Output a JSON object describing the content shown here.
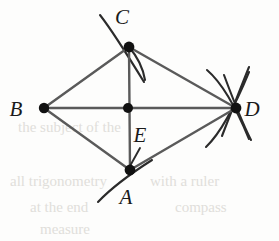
{
  "figure": {
    "type": "geometry-diagram",
    "background_color": "#fdfdfc",
    "line_color": "#5a5a5a",
    "arc_color": "#2b2b2b",
    "point_color": "#111111",
    "label_color": "#1a1a1a",
    "points": [
      {
        "id": "A",
        "label": "A",
        "x": 130,
        "y": 170,
        "label_x": 122,
        "label_y": 203
      },
      {
        "id": "B",
        "label": "B",
        "x": 44,
        "y": 108,
        "label_x": 16,
        "label_y": 116
      },
      {
        "id": "C",
        "label": "C",
        "x": 129,
        "y": 47,
        "label_x": 122,
        "label_y": 24
      },
      {
        "id": "D",
        "label": "D",
        "x": 236,
        "y": 108,
        "label_x": 247,
        "label_y": 116
      },
      {
        "id": "E",
        "label": "E",
        "x": 128,
        "y": 108,
        "label_x": 134,
        "label_y": 142
      }
    ],
    "segments": [
      {
        "from": "B",
        "to": "C"
      },
      {
        "from": "C",
        "to": "D"
      },
      {
        "from": "B",
        "to": "A"
      },
      {
        "from": "A",
        "to": "D"
      },
      {
        "from": "B",
        "to": "D"
      },
      {
        "from": "C",
        "to": "A"
      }
    ],
    "leader_line": {
      "from_label": "E",
      "x1": 140,
      "y1": 148,
      "x2": 130,
      "y2": 166
    },
    "arcs": [
      {
        "at": "C",
        "name": "arc-c-upper-left"
      },
      {
        "at": "C",
        "name": "arc-c-lower-right"
      },
      {
        "at": "A",
        "name": "arc-a-lower-left"
      },
      {
        "at": "D",
        "name": "arc-d-upper-outer"
      },
      {
        "at": "D",
        "name": "arc-d-upper-inner"
      },
      {
        "at": "D",
        "name": "arc-d-lower-inner"
      },
      {
        "at": "D",
        "name": "arc-d-lower-outer"
      }
    ],
    "ghost_lines": [
      {
        "text": "the subject of the",
        "x": 18,
        "y": 132
      },
      {
        "text": "all trigonometry",
        "x": 10,
        "y": 186
      },
      {
        "text": "with a ruler",
        "x": 150,
        "y": 186
      },
      {
        "text": "at the end",
        "x": 30,
        "y": 212
      },
      {
        "text": "compass",
        "x": 175,
        "y": 212
      },
      {
        "text": "measure",
        "x": 40,
        "y": 234
      }
    ]
  }
}
